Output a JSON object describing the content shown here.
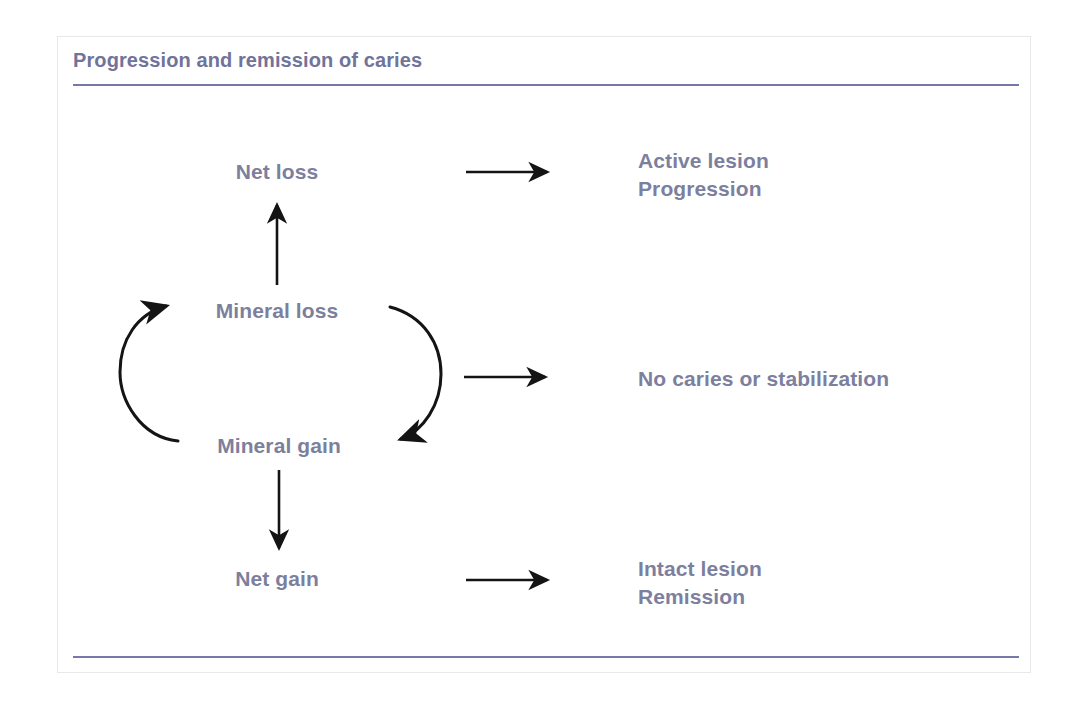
{
  "figure": {
    "title": "Progression and remission of caries",
    "title_color": "#70749a",
    "rule_color": "#7578a8",
    "frame_color": "#e7e7ec",
    "label_color": "#7c7f9e",
    "arrow_color": "#141414",
    "background": "#ffffff"
  },
  "diagram": {
    "type": "cycle-flow",
    "nodes": [
      {
        "id": "net-loss",
        "label": "Net loss"
      },
      {
        "id": "mineral-loss",
        "label": "Mineral loss"
      },
      {
        "id": "mineral-gain",
        "label": "Mineral gain"
      },
      {
        "id": "net-gain",
        "label": "Net gain"
      }
    ],
    "outcomes": [
      {
        "id": "outcome-top",
        "label": "Active lesion\nProgression"
      },
      {
        "id": "outcome-middle",
        "label": "No caries or stabilization"
      },
      {
        "id": "outcome-bottom",
        "label": "Intact lesion\nRemission"
      }
    ],
    "edges": [
      {
        "id": "edge-mineral-loss-to-net-loss",
        "from": "mineral-loss",
        "to": "net-loss",
        "style": "straight-up"
      },
      {
        "id": "edge-mineral-gain-to-net-gain",
        "from": "mineral-gain",
        "to": "net-gain",
        "style": "straight-down"
      },
      {
        "id": "edge-gain-to-loss-arc",
        "from": "mineral-gain",
        "to": "mineral-loss",
        "style": "arc-left"
      },
      {
        "id": "edge-loss-to-gain-arc",
        "from": "mineral-loss",
        "to": "mineral-gain",
        "style": "arc-right"
      },
      {
        "id": "edge-net-loss-to-outcome",
        "from": "net-loss",
        "to": "outcome-top",
        "style": "straight-right"
      },
      {
        "id": "edge-cycle-to-outcome",
        "from": "cycle",
        "to": "outcome-middle",
        "style": "straight-right"
      },
      {
        "id": "edge-net-gain-to-outcome",
        "from": "net-gain",
        "to": "outcome-bottom",
        "style": "straight-right"
      }
    ]
  }
}
